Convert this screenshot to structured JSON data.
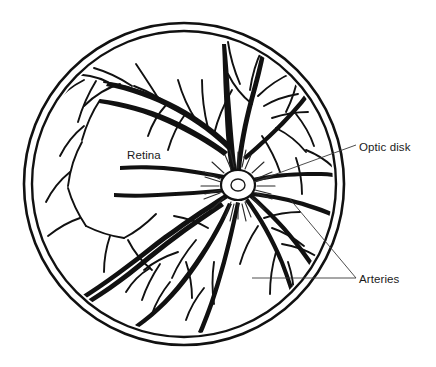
{
  "figure": {
    "kind": "anatomical-line-diagram",
    "background_color": "#ffffff",
    "ink_color": "#111111",
    "leader_line_color": "#3a3a3a"
  },
  "labels": {
    "retina": "Retina",
    "optic_disk": "Optic disk",
    "arteries": "Arteries"
  },
  "structures": {
    "eyeball_outline": "double-ring circle",
    "optic_disk": "radiating hub where vessels converge",
    "vessels": "branching retinal arteries and veins"
  }
}
